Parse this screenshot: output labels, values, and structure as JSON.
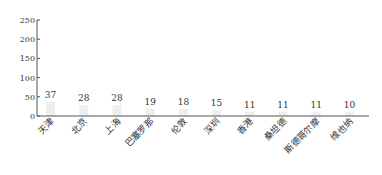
{
  "chart_data": {
    "type": "bar",
    "title": "",
    "xlabel": "",
    "ylabel": "",
    "categories": [
      "天津",
      "北京",
      "上海",
      "巴塞罗那",
      "伦敦",
      "深圳",
      "香港",
      "桑坦德",
      "斯德哥尔摩",
      "维也纳"
    ],
    "values": [
      37,
      28,
      28,
      19,
      18,
      15,
      11,
      11,
      11,
      10
    ],
    "ylim": [
      0,
      250
    ],
    "yticks": [
      0,
      50,
      100,
      150,
      200,
      250
    ],
    "grid": false,
    "legend": null,
    "bar_color": "#eeeeee",
    "axis_color": "#555555",
    "data_labels": true,
    "x_label_rotation": -45
  }
}
